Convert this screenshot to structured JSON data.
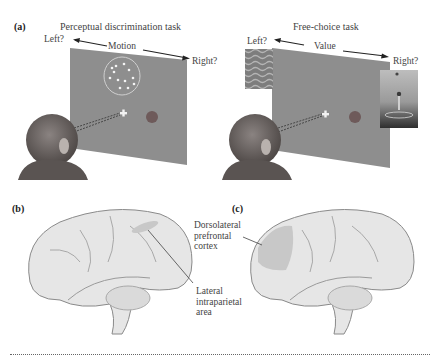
{
  "figure": {
    "panel_a": {
      "label": "(a)",
      "left_task": {
        "title": "Perceptual discrimination task",
        "left_label": "Left?",
        "axis_label": "Motion",
        "right_label": "Right?"
      },
      "right_task": {
        "title": "Free-choice task",
        "left_label": "Left?",
        "axis_label": "Value",
        "right_label": "Right?"
      }
    },
    "panel_b": {
      "label": "(b)",
      "annotation": "Lateral intraparietal area",
      "annotation_lines": [
        "Lateral",
        "intraparietal",
        "area"
      ]
    },
    "panel_c": {
      "label": "(c)",
      "annotation": "Dorsolateral prefrontal cortex",
      "annotation_lines": [
        "Dorsolateral",
        "prefrontal",
        "cortex"
      ]
    },
    "colors": {
      "screen": "#8e8e8e",
      "target_dot": "#6e5a5a",
      "brain_fill": "#e6e6e6",
      "brain_outline": "#8a8a8a",
      "highlight_region": "#c8c8c8",
      "monkey": "#6a6462"
    }
  }
}
